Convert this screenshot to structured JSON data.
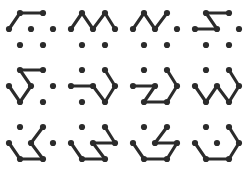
{
  "figure": {
    "type": "dot-lattice-path-puzzle-grid",
    "background_color": "#ffffff",
    "ink_color": "#2b2b2b",
    "rows": 3,
    "columns": 4,
    "panel_count": 12,
    "dot_radius": 3.1,
    "edge_width": 3.1
  },
  "lattice": {
    "description": "Seven-dot hexagonal lattice used by every panel",
    "nodes": [
      {
        "id": "tl",
        "label": "top-left",
        "x": 20,
        "y": 13
      },
      {
        "id": "tr",
        "label": "top-right",
        "x": 43,
        "y": 13
      },
      {
        "id": "ml",
        "label": "middle-left",
        "x": 9,
        "y": 29
      },
      {
        "id": "mc",
        "label": "middle-center",
        "x": 31,
        "y": 29
      },
      {
        "id": "mr",
        "label": "middle-right",
        "x": 53,
        "y": 29
      },
      {
        "id": "bl",
        "label": "bottom-left",
        "x": 20,
        "y": 45
      },
      {
        "id": "br",
        "label": "bottom-right",
        "x": 43,
        "y": 45
      }
    ]
  },
  "panels": [
    {
      "index": 1,
      "name": "panel-r1c1",
      "row": 1,
      "column": 1,
      "path": [
        "ml",
        "tl",
        "tr"
      ],
      "edges": [
        [
          "ml",
          "tl"
        ],
        [
          "tl",
          "tr"
        ]
      ],
      "segment_count": 2
    },
    {
      "index": 2,
      "name": "panel-r1c2",
      "row": 1,
      "column": 2,
      "path": [
        "ml",
        "tl",
        "mc",
        "tr",
        "mr"
      ],
      "edges": [
        [
          "ml",
          "tl"
        ],
        [
          "tl",
          "mc"
        ],
        [
          "mc",
          "tr"
        ],
        [
          "tr",
          "mr"
        ]
      ],
      "segment_count": 4
    },
    {
      "index": 3,
      "name": "panel-r1c3",
      "row": 1,
      "column": 3,
      "path": [
        "ml",
        "tl",
        "mc",
        "tr"
      ],
      "edges": [
        [
          "ml",
          "tl"
        ],
        [
          "tl",
          "mc"
        ],
        [
          "mc",
          "tr"
        ]
      ],
      "segment_count": 3
    },
    {
      "index": 4,
      "name": "panel-r1c4",
      "row": 1,
      "column": 4,
      "path": [
        "ml",
        "mc",
        "tl",
        "tr"
      ],
      "edges": [
        [
          "ml",
          "mc"
        ],
        [
          "mc",
          "tl"
        ],
        [
          "tl",
          "tr"
        ]
      ],
      "segment_count": 3
    },
    {
      "index": 5,
      "name": "panel-r2c1",
      "row": 2,
      "column": 1,
      "path": [
        "ml",
        "bl",
        "mc",
        "tl",
        "tr"
      ],
      "edges": [
        [
          "ml",
          "bl"
        ],
        [
          "bl",
          "mc"
        ],
        [
          "mc",
          "tl"
        ],
        [
          "tl",
          "tr"
        ]
      ],
      "segment_count": 4
    },
    {
      "index": 6,
      "name": "panel-r2c2",
      "row": 2,
      "column": 2,
      "path": [
        "ml",
        "mc",
        "br",
        "mr",
        "tr"
      ],
      "edges": [
        [
          "ml",
          "mc"
        ],
        [
          "mc",
          "br"
        ],
        [
          "br",
          "mr"
        ],
        [
          "mr",
          "tr"
        ]
      ],
      "segment_count": 4
    },
    {
      "index": 7,
      "name": "panel-r2c3",
      "row": 2,
      "column": 3,
      "path": [
        "ml",
        "mc",
        "bl",
        "br",
        "mr",
        "tr"
      ],
      "edges": [
        [
          "ml",
          "mc"
        ],
        [
          "mc",
          "bl"
        ],
        [
          "bl",
          "br"
        ],
        [
          "br",
          "mr"
        ],
        [
          "mr",
          "tr"
        ]
      ],
      "segment_count": 5
    },
    {
      "index": 8,
      "name": "panel-r2c4",
      "row": 2,
      "column": 4,
      "path": [
        "ml",
        "bl",
        "mc",
        "br",
        "mr",
        "tr"
      ],
      "edges": [
        [
          "ml",
          "bl"
        ],
        [
          "bl",
          "mc"
        ],
        [
          "mc",
          "br"
        ],
        [
          "br",
          "mr"
        ],
        [
          "mr",
          "tr"
        ]
      ],
      "segment_count": 5
    },
    {
      "index": 9,
      "name": "panel-r3c1",
      "row": 3,
      "column": 1,
      "path": [
        "ml",
        "bl",
        "br",
        "mc",
        "tr"
      ],
      "edges": [
        [
          "ml",
          "bl"
        ],
        [
          "bl",
          "br"
        ],
        [
          "br",
          "mc"
        ],
        [
          "mc",
          "tr"
        ]
      ],
      "segment_count": 4
    },
    {
      "index": 10,
      "name": "panel-r3c2",
      "row": 3,
      "column": 2,
      "path": [
        "ml",
        "bl",
        "br",
        "mc",
        "mr",
        "tr"
      ],
      "edges": [
        [
          "ml",
          "bl"
        ],
        [
          "bl",
          "br"
        ],
        [
          "br",
          "mc"
        ],
        [
          "mc",
          "mr"
        ],
        [
          "mr",
          "tr"
        ]
      ],
      "segment_count": 5
    },
    {
      "index": 11,
      "name": "panel-r3c3",
      "row": 3,
      "column": 3,
      "path": [
        "ml",
        "bl",
        "br",
        "mr",
        "mc",
        "tr"
      ],
      "edges": [
        [
          "ml",
          "bl"
        ],
        [
          "bl",
          "br"
        ],
        [
          "br",
          "mr"
        ],
        [
          "mr",
          "mc"
        ],
        [
          "mc",
          "tr"
        ]
      ],
      "segment_count": 5
    },
    {
      "index": 12,
      "name": "panel-r3c4",
      "row": 3,
      "column": 4,
      "path": [
        "ml",
        "bl",
        "br",
        "mr",
        "tr"
      ],
      "edges": [
        [
          "ml",
          "bl"
        ],
        [
          "bl",
          "br"
        ],
        [
          "br",
          "mr"
        ],
        [
          "mr",
          "tr"
        ]
      ],
      "segment_count": 4
    }
  ]
}
